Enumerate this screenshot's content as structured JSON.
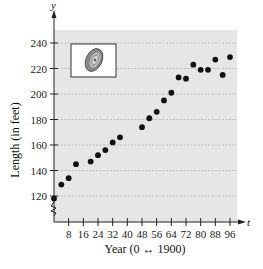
{
  "chart_data": {
    "type": "scatter",
    "title": "",
    "xlabel": "Year (0 ↔ 1900)",
    "ylabel": "Length (in feet)",
    "x_axis_variable": "t",
    "y_axis_variable": "y",
    "xlim": [
      0,
      96
    ],
    "ylim": [
      120,
      240
    ],
    "y_axis_break": true,
    "grid": "horizontal dashed",
    "x_ticks": [
      8,
      16,
      24,
      32,
      40,
      48,
      56,
      64,
      72,
      80,
      88,
      96
    ],
    "y_ticks": [
      120,
      140,
      160,
      180,
      200,
      220,
      240
    ],
    "inset": "photo of a discus",
    "legend": null,
    "series": [
      {
        "name": "Length",
        "x": [
          0,
          4,
          8,
          12,
          20,
          24,
          28,
          32,
          36,
          48,
          52,
          56,
          60,
          64,
          68,
          72,
          76,
          80,
          84,
          88,
          92,
          96
        ],
        "values": [
          118,
          129,
          134,
          145,
          147,
          152,
          156,
          162,
          166,
          174,
          181,
          186,
          195,
          201,
          213,
          212,
          223,
          219,
          219,
          227,
          215,
          229
        ]
      }
    ]
  },
  "colors": {
    "plot_background": "#e6e6e6",
    "grid": "#b0b0b0",
    "points": "#111111",
    "axis": "#222222"
  }
}
